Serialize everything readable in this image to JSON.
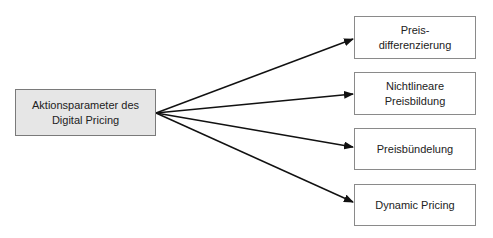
{
  "diagram": {
    "source": {
      "label_line1": "Aktionsparameter des",
      "label_line2": "Digital Pricing",
      "fill": "#e6e6e6"
    },
    "targets": [
      {
        "label_line1": "Preis-",
        "label_line2": "differenzierung"
      },
      {
        "label_line1": "Nichtlineare",
        "label_line2": "Preisbildung"
      },
      {
        "label_line1": "Preisbündelung",
        "label_line2": ""
      },
      {
        "label_line1": "Dynamic Pricing",
        "label_line2": ""
      }
    ],
    "edges": [
      {
        "from": "source",
        "to": "targets.0"
      },
      {
        "from": "source",
        "to": "targets.1"
      },
      {
        "from": "source",
        "to": "targets.2"
      },
      {
        "from": "source",
        "to": "targets.3"
      }
    ]
  }
}
